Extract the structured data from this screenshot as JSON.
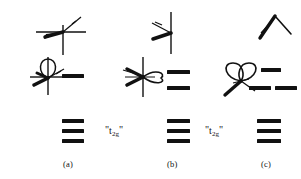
{
  "figure": {
    "type": "orbital-splitting-diagram",
    "background_color": "#ffffff",
    "ink_color": "#111111",
    "panels": [
      {
        "id": "a",
        "caption": "(a)",
        "term_label": null,
        "rows": [
          {
            "row": "upper",
            "orbital_icon": "d-orbital-lobes-with-axes-upper-a",
            "orbital_description": "crossed-axes with thick diagonal lobe",
            "levels": []
          },
          {
            "row": "middle",
            "orbital_icon": "d-orbital-single-loop-with-axes-a",
            "orbital_description": "vertical axis with single teardrop loop and short diagonal lobes",
            "levels": [
              {
                "index": 0,
                "label": "",
                "offset": "center"
              }
            ]
          },
          {
            "row": "lower",
            "orbital_icon": null,
            "orbital_description": "",
            "levels": [
              {
                "index": 0,
                "label": "",
                "offset": "center"
              },
              {
                "index": 1,
                "label": "",
                "offset": "center"
              },
              {
                "index": 2,
                "label": "",
                "offset": "center"
              }
            ]
          }
        ]
      },
      {
        "id": "b",
        "caption": "(b)",
        "term_label": {
          "quote_open": "\"",
          "symbol": "t",
          "subscript": "2g",
          "quote_close": "\""
        },
        "rows": [
          {
            "row": "upper",
            "orbital_icon": "d-orbital-lobes-with-vertical-axis-b",
            "orbital_description": "vertical axis with thick lobe pointing lower-left and thin dashed lobe",
            "levels": []
          },
          {
            "row": "middle",
            "orbital_icon": "d-orbital-loop-right-with-axes-b",
            "orbital_description": "crossed axes with heart shaped loop opening right",
            "levels": [
              {
                "index": 0,
                "label": "",
                "offset": "center"
              },
              {
                "index": 1,
                "label": "",
                "offset": "center"
              }
            ]
          },
          {
            "row": "lower",
            "orbital_icon": null,
            "orbital_description": "",
            "levels": [
              {
                "index": 0,
                "label": "",
                "offset": "center"
              },
              {
                "index": 1,
                "label": "",
                "offset": "center"
              },
              {
                "index": 2,
                "label": "",
                "offset": "center"
              }
            ]
          }
        ]
      },
      {
        "id": "c",
        "caption": "(c)",
        "term_label": {
          "quote_open": "\"",
          "symbol": "t",
          "subscript": "2g",
          "quote_close": "\""
        },
        "rows": [
          {
            "row": "upper",
            "orbital_icon": "inverted-v-lobes-c",
            "orbital_description": "inverted V shaped pair of lobes",
            "levels": []
          },
          {
            "row": "middle",
            "orbital_icon": "double-loop-bowtie-with-axis-c",
            "orbital_description": "double loop bowtie shape with diagonal axis",
            "levels": [
              {
                "index": 0,
                "label": "",
                "offset": "center-upper"
              },
              {
                "index": 1,
                "label": "",
                "offset": "left-lower"
              },
              {
                "index": 2,
                "label": "",
                "offset": "right-lower"
              }
            ]
          },
          {
            "row": "lower",
            "orbital_icon": null,
            "orbital_description": "",
            "levels": [
              {
                "index": 0,
                "label": "",
                "offset": "center"
              },
              {
                "index": 1,
                "label": "",
                "offset": "center"
              },
              {
                "index": 2,
                "label": "",
                "offset": "center"
              }
            ]
          }
        ]
      }
    ]
  }
}
